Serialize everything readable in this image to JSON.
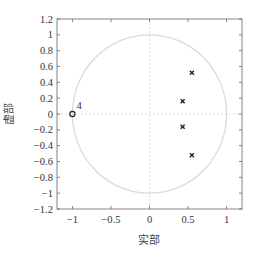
{
  "chart_data": {
    "type": "scatter",
    "title": "",
    "xlabel": "实部",
    "ylabel": "虚部",
    "xlim": [
      -1.2,
      1.2
    ],
    "ylim": [
      -1.2,
      1.2
    ],
    "grid": false,
    "x_ticks": [
      -1,
      -0.5,
      0,
      0.5,
      1
    ],
    "x_tick_labels": [
      "−1",
      "−0.5",
      "0",
      "0.5",
      "1"
    ],
    "y_ticks": [
      1.2,
      1,
      0.8,
      0.6,
      0.4,
      0.2,
      0,
      -0.2,
      -0.4,
      -0.6,
      -0.8,
      -1,
      -1.2
    ],
    "y_tick_labels": [
      "1.2",
      "1",
      "0.8",
      "0.6",
      "0.4",
      "0.2",
      "0",
      "−0.2",
      "−0.4",
      "−0.6",
      "−0.8",
      "−1",
      "−1.2"
    ],
    "unit_circle": true,
    "series": [
      {
        "name": "poles",
        "marker": "x",
        "points": [
          {
            "x": 0.55,
            "y": 0.52
          },
          {
            "x": 0.43,
            "y": 0.16
          },
          {
            "x": 0.43,
            "y": -0.16
          },
          {
            "x": 0.55,
            "y": -0.52
          }
        ]
      },
      {
        "name": "zeros",
        "marker": "o",
        "points": [
          {
            "x": -1,
            "y": 0,
            "multiplicity": 4
          }
        ]
      }
    ],
    "annotations": [
      {
        "text": "4",
        "x": -1,
        "y": 0
      }
    ],
    "colors": {
      "axes": "#666666",
      "unit_circle": "#d9d9d9",
      "crosshair": "#dddddd",
      "marker": "#222222"
    }
  }
}
